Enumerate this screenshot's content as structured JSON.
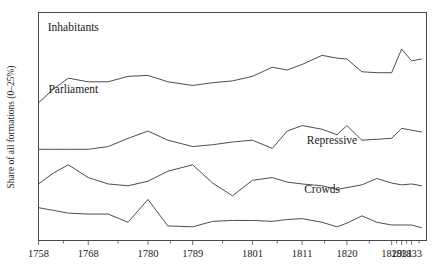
{
  "chart_data": {
    "type": "line",
    "title": "",
    "xlabel": "",
    "ylabel": "Share of all formations (0–25%)",
    "grid": false,
    "legend_position": "inline-above-each-series",
    "xlim": [
      1758,
      1836
    ],
    "ylim": [
      0,
      25
    ],
    "x_tick_labels": [
      "1758",
      "1768",
      "1780",
      "1789",
      "1801",
      "1811",
      "1820",
      "1829",
      "1831",
      "1833"
    ],
    "x_tick_values": [
      1758,
      1768,
      1780,
      1789,
      1801,
      1811,
      1820,
      1829,
      1831,
      1833
    ],
    "minor_ticks_between_labels": true,
    "y_axis_ticks_shown": false,
    "series": [
      {
        "name": "Inhabitants",
        "label": "Inhabitants",
        "label_x": 1765,
        "label_y": 23.0,
        "x": [
          1758,
          1761,
          1764,
          1768,
          1772,
          1776,
          1780,
          1784,
          1789,
          1793,
          1797,
          1801,
          1805,
          1808,
          1811,
          1815,
          1818,
          1820,
          1823,
          1826,
          1829,
          1831,
          1833,
          1835
        ],
        "values": [
          15.1,
          16.6,
          17.8,
          17.4,
          17.4,
          18.0,
          18.1,
          17.4,
          17.0,
          17.3,
          17.5,
          18.0,
          19.0,
          18.7,
          19.3,
          20.3,
          20.0,
          19.9,
          18.5,
          18.4,
          18.4,
          21.0,
          19.7,
          19.9
        ]
      },
      {
        "name": "Parliament",
        "label": "Parliament",
        "label_x": 1765,
        "label_y": 16.2,
        "x": [
          1758,
          1761,
          1764,
          1768,
          1772,
          1776,
          1780,
          1784,
          1789,
          1793,
          1797,
          1801,
          1805,
          1808,
          1811,
          1815,
          1818,
          1820,
          1823,
          1826,
          1829,
          1831,
          1833,
          1835
        ],
        "values": [
          10.0,
          10.0,
          10.0,
          10.0,
          10.3,
          11.2,
          12.0,
          11.0,
          10.3,
          10.5,
          10.8,
          11.0,
          10.1,
          12.0,
          12.6,
          12.2,
          11.6,
          12.6,
          11.0,
          11.1,
          11.2,
          12.3,
          12.1,
          11.9
        ]
      },
      {
        "name": "Repressive",
        "label": "Repressive",
        "label_x": 1817,
        "label_y": 10.6,
        "x": [
          1758,
          1761,
          1764,
          1768,
          1772,
          1776,
          1780,
          1784,
          1789,
          1793,
          1797,
          1801,
          1805,
          1808,
          1811,
          1815,
          1818,
          1820,
          1823,
          1826,
          1829,
          1831,
          1833,
          1835
        ],
        "values": [
          6.2,
          7.4,
          8.3,
          6.9,
          6.2,
          6.0,
          6.5,
          7.6,
          8.3,
          6.3,
          4.9,
          6.6,
          6.9,
          6.4,
          6.2,
          6.0,
          5.6,
          5.8,
          6.1,
          6.8,
          6.3,
          6.1,
          6.2,
          6.0
        ]
      },
      {
        "name": "Crowds",
        "label": "Crowds",
        "label_x": 1815,
        "label_y": 5.2,
        "x": [
          1758,
          1761,
          1764,
          1768,
          1772,
          1776,
          1780,
          1784,
          1789,
          1793,
          1797,
          1801,
          1805,
          1808,
          1811,
          1815,
          1818,
          1820,
          1823,
          1826,
          1829,
          1831,
          1833,
          1835
        ],
        "values": [
          3.6,
          3.3,
          3.0,
          2.9,
          2.9,
          2.0,
          4.5,
          1.6,
          1.5,
          2.1,
          2.2,
          2.2,
          2.1,
          2.3,
          2.4,
          2.0,
          1.5,
          1.9,
          2.7,
          2.0,
          1.7,
          1.7,
          1.7,
          1.4
        ]
      }
    ]
  }
}
